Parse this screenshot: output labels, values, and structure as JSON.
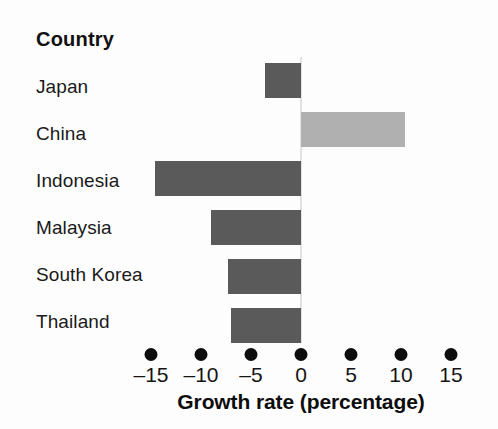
{
  "chart_data": {
    "type": "bar",
    "orientation": "horizontal",
    "title": "",
    "subtitle": "",
    "xlabel": "Growth rate (percentage)",
    "ylabel": "Country",
    "categories": [
      "Japan",
      "China",
      "Indonesia",
      "Malaysia",
      "South Korea",
      "Thailand"
    ],
    "values": [
      -3.6,
      10.4,
      -14.6,
      -9.0,
      -7.3,
      -7.0
    ],
    "xlim": [
      -17.5,
      17.5
    ],
    "xticks": [
      -15,
      -10,
      -5,
      0,
      5,
      10,
      15
    ],
    "xtick_labels": [
      "–15",
      "–10",
      "–5",
      "0",
      "5",
      "10",
      "15"
    ],
    "grid": false,
    "legend": false,
    "legend_position": "none",
    "bar_colors": [
      "#5a5a5a",
      "#b0b0b0",
      "#5a5a5a",
      "#5a5a5a",
      "#5a5a5a",
      "#5a5a5a"
    ],
    "annotations": []
  },
  "axis": {
    "category_header": "Country",
    "x_axis_title": "Growth rate (percentage)",
    "tick_marker_style": "dot"
  },
  "colors": {
    "bar_negative": "#5a5a5a",
    "bar_positive": "#b0b0b0",
    "zero_line": "#e2e2e2",
    "text": "#141414",
    "background": "#fdfdfd",
    "tick_dot": "#0d0d0d"
  },
  "geometry": {
    "zero_x_px": 301,
    "px_per_unit": 10.0,
    "first_row_top_px": 63,
    "row_pitch_px": 49,
    "bar_height_px": 35,
    "label_first_baseline_px": 95,
    "label_pitch_px": 47
  }
}
